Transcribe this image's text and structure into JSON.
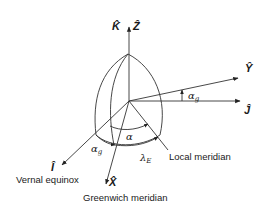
{
  "diagram": {
    "axes": {
      "K": "K̂",
      "Z": "Ẑ",
      "Y": "Ŷ",
      "J": "Ĵ",
      "I": "Î",
      "X": "X̂"
    },
    "angles": {
      "alpha_g_top": "α",
      "alpha_g_top_sub": "g",
      "alpha": "α",
      "alpha_g_bottom": "α",
      "alpha_g_bottom_sub": "g",
      "lambda_e": "λ",
      "lambda_e_sub": "E"
    },
    "labels": {
      "local_meridian": "Local meridian",
      "vernal_equinox": "Vernal equinox",
      "greenwich_meridian": "Greenwich meridian"
    },
    "colors": {
      "line": "#333333",
      "text": "#1a1a1a"
    }
  }
}
